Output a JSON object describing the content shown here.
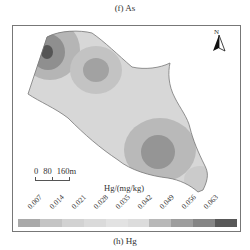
{
  "top_caption": "(f) As",
  "bottom_caption": "(h) Hg",
  "north_arrow": {
    "label": "N",
    "icon": "north-arrow-icon"
  },
  "scale_bar": {
    "labels": [
      "0",
      "80",
      "160m"
    ]
  },
  "legend": {
    "title": "Hg/(mg/kg)",
    "ticks": [
      "0.007",
      "0.014",
      "0.021",
      "0.028",
      "0.035",
      "0.042",
      "0.049",
      "0.056",
      "0.063"
    ],
    "colors": [
      "#a9a9a9",
      "#c4c4c4",
      "#d2d2d2",
      "#dadada",
      "#e2e2e2",
      "#dcdcdc",
      "#b8b8b8",
      "#9d9d9d",
      "#858585",
      "#585858"
    ]
  },
  "chart_data": {
    "type": "heatmap",
    "title": "(h) Hg",
    "legend_title": "Hg/(mg/kg)",
    "class_breaks": [
      0.007,
      0.014,
      0.021,
      0.028,
      0.035,
      0.042,
      0.049,
      0.056,
      0.063
    ],
    "scale_bar_m": [
      0,
      80,
      160
    ],
    "hotspots": [
      {
        "location": "northwest tip",
        "level": "highest (>0.063)"
      },
      {
        "location": "upper-center",
        "level": "0.049-0.056"
      },
      {
        "location": "south-center",
        "level": "0.049-0.056"
      }
    ]
  }
}
